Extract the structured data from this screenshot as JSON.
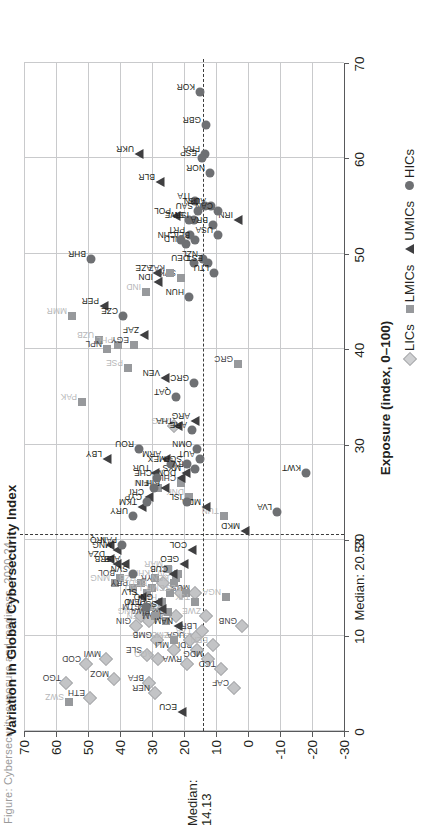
{
  "figure": {
    "title_faint": "Figure: Cybersecurity exposure and readiness, 2020-24",
    "xlabel": "Exposure (index, 0–100)",
    "ylabel": "Variation in Global Cybersecurity Index",
    "median_x_label": "Median: 20.53",
    "median_y_label_line1": "Median:",
    "median_y_label_line2": "14.13"
  },
  "legend": {
    "position": "bottom-right",
    "items": [
      {
        "key": "lic",
        "label": "LICs"
      },
      {
        "key": "lmic",
        "label": "LMICs"
      },
      {
        "key": "umic",
        "label": "UMICs"
      },
      {
        "key": "hic",
        "label": "HICs"
      }
    ]
  },
  "chart_data": {
    "type": "scatter",
    "title": "",
    "xlabel": "Exposure (index, 0–100)",
    "ylabel": "Variation in Global Cybersecurity Index",
    "xlim": [
      0,
      70
    ],
    "ylim": [
      -30,
      70
    ],
    "xticks": [
      0,
      10,
      20,
      30,
      40,
      50,
      60,
      70
    ],
    "yticks": [
      -30,
      -20,
      -10,
      0,
      10,
      20,
      30,
      40,
      50,
      60,
      70
    ],
    "grid": true,
    "median_x": 20.53,
    "median_y": 14.13,
    "legend_position": "bottom-right",
    "series": [
      {
        "name": "LICs",
        "marker": "diamond",
        "color": "#c3c4c6",
        "points": [
          {
            "code": "TGO",
            "x": 5.0,
            "y": 57.0
          },
          {
            "code": "COD",
            "x": 7.0,
            "y": 50.5
          },
          {
            "code": "ETH",
            "x": 3.5,
            "y": 49.5
          },
          {
            "code": "MWI",
            "x": 7.5,
            "y": 44.5
          },
          {
            "code": "MOZ",
            "x": 5.5,
            "y": 42.0
          },
          {
            "code": "GIN",
            "x": 11.0,
            "y": 35.0
          },
          {
            "code": "SLE",
            "x": 8.0,
            "y": 31.5
          },
          {
            "code": "BFA",
            "x": 5.0,
            "y": 31.0
          },
          {
            "code": "NER",
            "x": 4.0,
            "y": 29.0
          },
          {
            "code": "GMB",
            "x": 9.5,
            "y": 28.5
          },
          {
            "code": "SSD",
            "x": 12.5,
            "y": 27.5
          },
          {
            "code": "SEN",
            "x": 11.5,
            "y": 31.0,
            "fade": true
          },
          {
            "code": "PNG",
            "x": 12.0,
            "y": 33.5,
            "fade": true
          },
          {
            "code": "AGO",
            "x": 7.5,
            "y": 28.0,
            "fade": true
          },
          {
            "code": "MLI",
            "x": 8.5,
            "y": 23.0
          },
          {
            "code": "SYR",
            "x": 15.5,
            "y": 26.5
          },
          {
            "code": "RWA",
            "x": 7.0,
            "y": 19.0
          },
          {
            "code": "BDI",
            "x": 8.5,
            "y": 16.0
          },
          {
            "code": "UGA",
            "x": 9.5,
            "y": 18.0
          },
          {
            "code": "TZA",
            "x": 10.0,
            "y": 16.0,
            "fade": true
          },
          {
            "code": "MDG",
            "x": 7.5,
            "y": 12.5
          },
          {
            "code": "TCD",
            "x": 6.5,
            "y": 8.5
          },
          {
            "code": "GNB",
            "x": 11.0,
            "y": 2.0
          },
          {
            "code": "CAF",
            "x": 4.5,
            "y": 4.5
          },
          {
            "code": "HTI",
            "x": 14.5,
            "y": 21.0,
            "fade": true
          },
          {
            "code": "ZWE",
            "x": 12.0,
            "y": 13.0,
            "fade": true
          },
          {
            "code": "AFG",
            "x": 32.0,
            "y": 23.0,
            "fade": true
          },
          {
            "code": "MUS",
            "x": 14.5,
            "y": 16.5
          },
          {
            "code": "BEN",
            "x": 9.0,
            "y": 11.0,
            "fade": true
          },
          {
            "code": "SOM",
            "x": 12.0,
            "y": 22.5
          },
          {
            "code": "LBR",
            "x": 10.5,
            "y": 14.5
          }
        ]
      },
      {
        "name": "LMICs",
        "marker": "square",
        "color": "#97999c",
        "points": [
          {
            "code": "SWZ",
            "x": 3.0,
            "y": 56.0,
            "fade": true
          },
          {
            "code": "MMR",
            "x": 43.5,
            "y": 55.0,
            "fade": true
          },
          {
            "code": "UZB",
            "x": 41.0,
            "y": 46.5,
            "fade": true
          },
          {
            "code": "NPL",
            "x": 40.0,
            "y": 44.0
          },
          {
            "code": "PHL",
            "x": 40.5,
            "y": 40.5,
            "fade": true
          },
          {
            "code": "PSE",
            "x": 38.0,
            "y": 37.5,
            "fade": true
          },
          {
            "code": "EGY",
            "x": 40.5,
            "y": 35.5
          },
          {
            "code": "PAK",
            "x": 34.5,
            "y": 52.0,
            "fade": true
          },
          {
            "code": "BOL",
            "x": 16.0,
            "y": 40.0
          },
          {
            "code": "MNG",
            "x": 15.5,
            "y": 41.5,
            "fade": true
          },
          {
            "code": "PRY",
            "x": 15.0,
            "y": 36.0
          },
          {
            "code": "UZB2",
            "x": 15.5,
            "y": 33.5,
            "fade": true
          },
          {
            "code": "IND",
            "x": 46.0,
            "y": 32.0,
            "fade": true
          },
          {
            "code": "GTM",
            "x": 12.5,
            "y": 32.0
          },
          {
            "code": "JAM",
            "x": 13.0,
            "y": 31.0
          },
          {
            "code": "LAO",
            "x": 14.5,
            "y": 31.5,
            "fade": true
          },
          {
            "code": "BGD",
            "x": 15.0,
            "y": 30.0,
            "fade": true
          },
          {
            "code": "KHM",
            "x": 16.0,
            "y": 29.0,
            "fade": true
          },
          {
            "code": "HND",
            "x": 13.5,
            "y": 27.0,
            "fade": true
          },
          {
            "code": "MRT",
            "x": 12.5,
            "y": 25.0,
            "fade": true
          },
          {
            "code": "CMR",
            "x": 14.5,
            "y": 24.5,
            "fade": true
          },
          {
            "code": "KEN",
            "x": 15.5,
            "y": 23.0,
            "fade": true
          },
          {
            "code": "CIV",
            "x": 16.0,
            "y": 22.5,
            "fade": true
          },
          {
            "code": "NIC",
            "x": 16.5,
            "y": 22.0,
            "fade": true
          },
          {
            "code": "TLS",
            "x": 14.5,
            "y": 19.5,
            "fade": true
          },
          {
            "code": "ZMB",
            "x": 9.5,
            "y": 23.0,
            "fade": true
          },
          {
            "code": "NAM",
            "x": 11.5,
            "y": 25.5
          },
          {
            "code": "TJK",
            "x": 13.5,
            "y": 16.5,
            "fade": true
          },
          {
            "code": "NGA",
            "x": 14.0,
            "y": 7.0,
            "fade": true
          },
          {
            "code": "TUN",
            "x": 22.5,
            "y": 7.5,
            "fade": true
          },
          {
            "code": "GRC",
            "x": 38.5,
            "y": 3.0
          },
          {
            "code": "CHL",
            "x": 26.0,
            "y": 21.0
          },
          {
            "code": "SVK",
            "x": 47.5,
            "y": 21.0
          },
          {
            "code": "KAZ",
            "x": 48.0,
            "y": 24.5
          },
          {
            "code": "DNK",
            "x": 24.5,
            "y": 18.5,
            "fade": true
          },
          {
            "code": "MAR",
            "x": 17.0,
            "y": 25.0,
            "fade": true
          },
          {
            "code": "VNM",
            "x": 25.5,
            "y": 28.0,
            "fade": true
          },
          {
            "code": "BWA",
            "x": 12.0,
            "y": 29.0
          }
        ]
      },
      {
        "name": "UMICs",
        "marker": "triangle",
        "color": "#3f3f41",
        "points": [
          {
            "code": "ECU",
            "x": 2.0,
            "y": 20.5
          },
          {
            "code": "LBY",
            "x": 28.5,
            "y": 44.0
          },
          {
            "code": "DZA",
            "x": 18.0,
            "y": 43.0
          },
          {
            "code": "IRQ",
            "x": 19.5,
            "y": 43.0
          },
          {
            "code": "SRB",
            "x": 17.5,
            "y": 41.0
          },
          {
            "code": "ALB",
            "x": 17.5,
            "y": 38.5
          },
          {
            "code": "MNG2",
            "x": 19.0,
            "y": 41.0
          },
          {
            "code": "SLV",
            "x": 14.0,
            "y": 33.0
          },
          {
            "code": "GNQ",
            "x": 13.5,
            "y": 28.0
          },
          {
            "code": "GEO",
            "x": 17.5,
            "y": 20.0
          },
          {
            "code": "COL",
            "x": 19.0,
            "y": 17.5
          },
          {
            "code": "CUB",
            "x": 16.5,
            "y": 23.5
          },
          {
            "code": "TKM",
            "x": 23.5,
            "y": 33.0
          },
          {
            "code": "CRI",
            "x": 24.5,
            "y": 31.0
          },
          {
            "code": "BIH",
            "x": 25.5,
            "y": 26.0
          },
          {
            "code": "DOM",
            "x": 26.5,
            "y": 21.0
          },
          {
            "code": "TUR",
            "x": 27.0,
            "y": 29.0
          },
          {
            "code": "ARM",
            "x": 28.5,
            "y": 25.5
          },
          {
            "code": "VEN",
            "x": 37.0,
            "y": 26.0
          },
          {
            "code": "THA",
            "x": 32.0,
            "y": 22.0
          },
          {
            "code": "ARG",
            "x": 32.5,
            "y": 16.5
          },
          {
            "code": "ZAF",
            "x": 41.5,
            "y": 32.5
          },
          {
            "code": "PER",
            "x": 44.5,
            "y": 45.0
          },
          {
            "code": "IDN",
            "x": 47.0,
            "y": 28.0
          },
          {
            "code": "AZE",
            "x": 48.0,
            "y": 28.5
          },
          {
            "code": "MDA",
            "x": 23.5,
            "y": 13.0
          },
          {
            "code": "MKD",
            "x": 21.0,
            "y": 1.0
          },
          {
            "code": "IRN",
            "x": 53.5,
            "y": 3.0
          },
          {
            "code": "BLR",
            "x": 57.5,
            "y": 27.5
          },
          {
            "code": "UKR",
            "x": 60.5,
            "y": 34.0
          },
          {
            "code": "NAM2",
            "x": 11.0,
            "y": 22.0
          },
          {
            "code": "SSD2",
            "x": 12.8,
            "y": 27.0
          },
          {
            "code": "POL",
            "x": 54.0,
            "y": 22.5
          },
          {
            "code": "MYS",
            "x": 27.0,
            "y": 19.5
          }
        ]
      },
      {
        "name": "HICs",
        "marker": "circle",
        "color": "#6e7073",
        "points": [
          {
            "code": "KOR",
            "x": 67.0,
            "y": 15.0
          },
          {
            "code": "GBR",
            "x": 63.5,
            "y": 13.0
          },
          {
            "code": "FRA",
            "x": 60.5,
            "y": 13.5
          },
          {
            "code": "ESP",
            "x": 60.0,
            "y": 14.5
          },
          {
            "code": "NOR",
            "x": 58.5,
            "y": 12.0
          },
          {
            "code": "ITA",
            "x": 55.5,
            "y": 16.5
          },
          {
            "code": "JPN",
            "x": 55.0,
            "y": 13.5
          },
          {
            "code": "SWE",
            "x": 53.5,
            "y": 18.5
          },
          {
            "code": "AUS",
            "x": 55.0,
            "y": 11.5
          },
          {
            "code": "CAN",
            "x": 54.5,
            "y": 9.5
          },
          {
            "code": "ISR",
            "x": 53.5,
            "y": 17.0
          },
          {
            "code": "SAU",
            "x": 54.5,
            "y": 15.5
          },
          {
            "code": "BRA",
            "x": 53.0,
            "y": 11.0
          },
          {
            "code": "USA",
            "x": 52.0,
            "y": 9.5
          },
          {
            "code": "PRT",
            "x": 52.0,
            "y": 18.0
          },
          {
            "code": "BEL",
            "x": 51.5,
            "y": 16.5
          },
          {
            "code": "NLD",
            "x": 51.0,
            "y": 19.5
          },
          {
            "code": "CHN",
            "x": 51.5,
            "y": 21.0
          },
          {
            "code": "DEU",
            "x": 49.0,
            "y": 17.0
          },
          {
            "code": "NZL",
            "x": 49.5,
            "y": 14.0
          },
          {
            "code": "EST",
            "x": 49.0,
            "y": 12.5
          },
          {
            "code": "LTU",
            "x": 48.0,
            "y": 10.5
          },
          {
            "code": "HUN",
            "x": 45.5,
            "y": 18.5
          },
          {
            "code": "BHR",
            "x": 49.5,
            "y": 49.0
          },
          {
            "code": "CZE",
            "x": 43.5,
            "y": 39.0
          },
          {
            "code": "QAT",
            "x": 35.0,
            "y": 22.5
          },
          {
            "code": "GRC2",
            "x": 36.5,
            "y": 17.0
          },
          {
            "code": "ARE",
            "x": 31.5,
            "y": 17.5
          },
          {
            "code": "KWT",
            "x": 27.0,
            "y": -18.0
          },
          {
            "code": "LVA",
            "x": 23.0,
            "y": -9.0
          },
          {
            "code": "MEX",
            "x": 28.0,
            "y": 24.0
          },
          {
            "code": "ROU",
            "x": 29.5,
            "y": 34.0
          },
          {
            "code": "PAN",
            "x": 19.5,
            "y": 39.5
          },
          {
            "code": "URY",
            "x": 22.5,
            "y": 36.0
          },
          {
            "code": "SVN",
            "x": 16.5,
            "y": 36.0
          },
          {
            "code": "CYP",
            "x": 24.0,
            "y": 31.5
          },
          {
            "code": "FIN",
            "x": 25.5,
            "y": 29.5
          },
          {
            "code": "CHE",
            "x": 26.5,
            "y": 28.5
          },
          {
            "code": "HRV",
            "x": 27.5,
            "y": 16.5
          },
          {
            "code": "AUT",
            "x": 28.5,
            "y": 15.0
          },
          {
            "code": "OMN",
            "x": 29.5,
            "y": 16.0
          },
          {
            "code": "TTO",
            "x": 13.0,
            "y": 32.0
          },
          {
            "code": "SGP",
            "x": 28.0,
            "y": 19.0
          },
          {
            "code": "ISL",
            "x": 24.0,
            "y": 19.0
          }
        ]
      }
    ]
  }
}
